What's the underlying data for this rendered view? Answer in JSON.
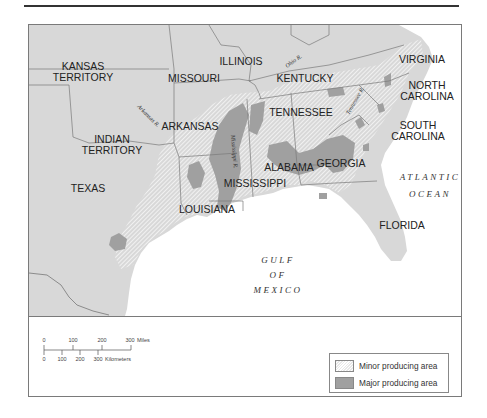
{
  "figure": {
    "type": "thematic-map"
  },
  "map": {
    "colors": {
      "land": "#d8d8d8",
      "water": "#ffffff",
      "major_area": "#a0a0a0",
      "hatch": "#ffffff",
      "border": "#7a7a7a"
    },
    "states": [
      {
        "id": "kansas-territory",
        "lines": [
          "KANSAS",
          "TERRITORY"
        ]
      },
      {
        "id": "missouri",
        "lines": [
          "MISSOURI"
        ]
      },
      {
        "id": "illinois",
        "lines": [
          "ILLINOIS"
        ]
      },
      {
        "id": "kentucky",
        "lines": [
          "KENTUCKY"
        ]
      },
      {
        "id": "virginia",
        "lines": [
          "VIRGINIA"
        ]
      },
      {
        "id": "north-carolina",
        "lines": [
          "NORTH",
          "CAROLINA"
        ]
      },
      {
        "id": "tennessee",
        "lines": [
          "TENNESSEE"
        ]
      },
      {
        "id": "arkansas",
        "lines": [
          "ARKANSAS"
        ]
      },
      {
        "id": "indian-territory",
        "lines": [
          "INDIAN",
          "TERRITORY"
        ]
      },
      {
        "id": "south-carolina",
        "lines": [
          "SOUTH",
          "CAROLINA"
        ]
      },
      {
        "id": "alabama",
        "lines": [
          "ALABAMA"
        ]
      },
      {
        "id": "georgia",
        "lines": [
          "GEORGIA"
        ]
      },
      {
        "id": "mississippi",
        "lines": [
          "MISSISSIPPI"
        ]
      },
      {
        "id": "texas",
        "lines": [
          "TEXAS"
        ]
      },
      {
        "id": "louisiana",
        "lines": [
          "LOUISIANA"
        ]
      },
      {
        "id": "florida",
        "lines": [
          "FLORIDA"
        ]
      }
    ],
    "rivers": [
      {
        "id": "arkansas-river",
        "label": "Arkansas R."
      },
      {
        "id": "ohio-river",
        "label": "Ohio R."
      },
      {
        "id": "tennessee-river",
        "label": "Tennessee R."
      },
      {
        "id": "mississippi-river",
        "label": "Mississippi R."
      }
    ],
    "water_bodies": [
      {
        "id": "atlantic-ocean",
        "lines": [
          "ATLANTIC",
          "OCEAN"
        ]
      },
      {
        "id": "gulf-of-mexico",
        "lines": [
          "GULF",
          "OF",
          "MEXICO"
        ]
      }
    ]
  },
  "scale_bar": {
    "miles": {
      "ticks": [
        "0",
        "100",
        "200",
        "300"
      ],
      "unit": "Miles"
    },
    "kilometers": {
      "ticks": [
        "0",
        "100",
        "200",
        "300"
      ],
      "unit": "Kilometers"
    }
  },
  "legend": {
    "items": [
      {
        "label": "Minor producing area",
        "pattern": "hatched"
      },
      {
        "label": "Major producing area",
        "color": "#a0a0a0"
      }
    ]
  }
}
